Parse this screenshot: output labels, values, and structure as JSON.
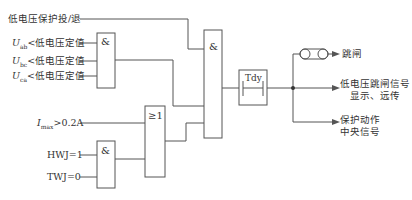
{
  "inputs": {
    "enable": "低电压保护投/退",
    "uab": {
      "sym": "U",
      "sub": "ab",
      "text": "<低电压定值"
    },
    "ubc": {
      "sym": "U",
      "sub": "bc",
      "text": "<低电压定值"
    },
    "uca": {
      "sym": "U",
      "sub": "ca",
      "text": "<低电压定值"
    },
    "imax": {
      "sym": "I",
      "sub": "max",
      "text": ">0.2A"
    },
    "hwj": "HWJ=1",
    "twj": "TWJ=0"
  },
  "gates": {
    "and_voltage": "&",
    "and_main": "&",
    "or_current": "≥1",
    "and_breaker": "&",
    "timer": "Tdy"
  },
  "outputs": {
    "trip": "跳闸",
    "signal_line1": "低电压跳闸信号",
    "signal_line2": "显示、远传",
    "central_line1": "保护动作",
    "central_line2": "中央信号"
  },
  "colors": {
    "line": "#555555",
    "text": "#333333"
  }
}
